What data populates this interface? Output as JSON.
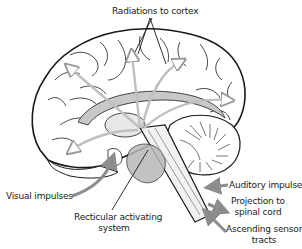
{
  "labels": {
    "radiations": "Radiations to cortex",
    "visual": "Visual impulses",
    "reticular_line1": "Recticular activating",
    "reticular_line2": "system",
    "auditory": "Auditory impulses",
    "projection_line1": "Projection to",
    "projection_line2": "spinal cord",
    "ascending_line1": "Ascending sensory",
    "ascending_line2": "tracts"
  },
  "colors": {
    "outline": "#1a1a1a",
    "arrow": "#8c8c8c",
    "arrow_light": "#c8c8c8",
    "shade": "#b0b0b0",
    "background": "#ffffff"
  }
}
